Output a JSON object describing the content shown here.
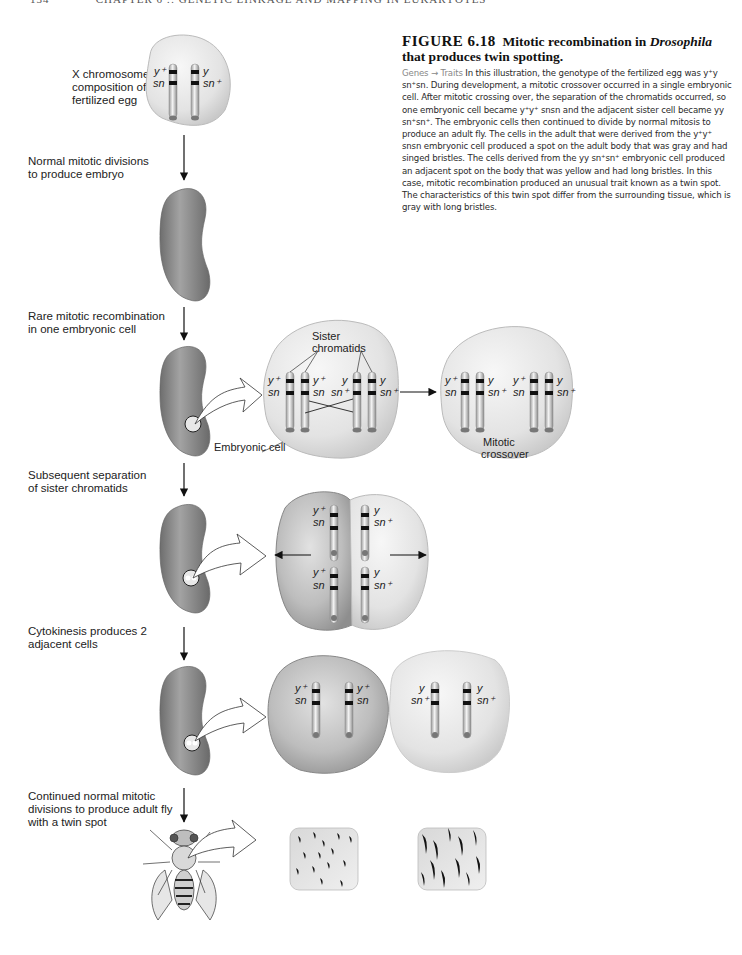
{
  "running_head": {
    "page_number": "134",
    "chapter": "CHAPTER 6 :: GENETIC LINKAGE AND MAPPING IN EUKARYOTES"
  },
  "figure": {
    "number": "FIGURE 6.18",
    "title_part1": "Mitotic recombination in ",
    "title_italic": "Drosophila",
    "title_part2": " that produces twin spotting.",
    "caption_lead": "Genes → Traits",
    "caption_body": " In this illustration, the genotype of the fertilized egg was y⁺y sn⁺sn. During development, a mitotic crossover occurred in a single embryonic cell. After mitotic crossing over, the separation of the chromatids occurred, so one embryonic cell became y⁺y⁺ snsn and the adjacent sister cell became yy sn⁺sn⁺. The embryonic cells then continued to divide by normal mitosis to produce an adult fly. The cells in the adult that were derived from the y⁺y⁺ snsn embryonic cell produced a spot on the adult body that was gray and had singed bristles. The cells derived from the yy sn⁺sn⁺ embryonic cell produced an adjacent spot on the body that was yellow and had long bristles. In this case, mitotic recombination produced an unusual trait known as a twin spot. The characteristics of this twin spot differ from the surrounding tissue, which is gray with long bristles."
  },
  "steps": [
    {
      "id": "egg",
      "label_lines": [
        "X chromosome",
        "composition of",
        "fertilized egg"
      ]
    },
    {
      "id": "embryo",
      "label_lines": [
        "Normal mitotic divisions",
        "to produce embryo"
      ]
    },
    {
      "id": "recombination",
      "label_lines": [
        "Rare mitotic recombination",
        "in one embryonic cell"
      ]
    },
    {
      "id": "separation",
      "label_lines": [
        "Subsequent separation",
        "of sister chromatids"
      ]
    },
    {
      "id": "cytokinesis",
      "label_lines": [
        "Cytokinesis produces 2",
        "adjacent cells"
      ]
    },
    {
      "id": "adult",
      "label_lines": [
        "Continued normal mitotic",
        "divisions to produce adult fly",
        "with a twin spot"
      ]
    }
  ],
  "alleles": {
    "y_plus": "y⁺",
    "y": "y",
    "sn": "sn",
    "sn_plus": "sn⁺"
  },
  "annotations": {
    "sister_chromatids_line1": "Sister",
    "sister_chromatids_line2": "chromatids",
    "embryonic_cell": "Embryonic cell",
    "mitotic_crossover_line1": "Mitotic",
    "mitotic_crossover_line2": "crossover"
  },
  "colors": {
    "cell_light": "#e6e6e6",
    "cell_dark": "#9a9a9a",
    "embryo": "#8a8a8a",
    "band": "#111111",
    "caption_lead": "#888888"
  }
}
